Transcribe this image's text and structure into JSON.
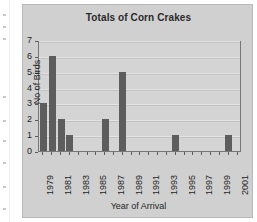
{
  "chart_data": {
    "type": "bar",
    "title": "Totals of Corn Crakes",
    "xlabel": "Year of Arrival",
    "ylabel": "No of Birds",
    "ylim": [
      0,
      7
    ],
    "yticks": [
      0,
      1,
      2,
      3,
      4,
      5,
      6,
      7
    ],
    "grid": true,
    "legend": false,
    "categories": [
      "1979",
      "1980",
      "1981",
      "1982",
      "1983",
      "1984",
      "1985",
      "1986",
      "1987",
      "1988",
      "1989",
      "1990",
      "1991",
      "1992",
      "1993",
      "1994",
      "1995",
      "1996",
      "1997",
      "1998",
      "1999",
      "2000",
      "2001"
    ],
    "xtick_labels_shown": [
      "1979",
      "1981",
      "1983",
      "1985",
      "1987",
      "1989",
      "1991",
      "1993",
      "1995",
      "1997",
      "1999",
      "2001"
    ],
    "values": [
      3,
      6,
      2,
      1,
      0,
      0,
      0,
      2,
      0,
      5,
      0,
      0,
      0,
      0,
      0,
      1,
      0,
      0,
      0,
      0,
      0,
      1,
      0
    ],
    "bar_color": "#5d5d5d",
    "plot_background": "#d4d4d4",
    "figure_background": "#d0d0d0",
    "gridline_color": "#c2c2c2"
  }
}
